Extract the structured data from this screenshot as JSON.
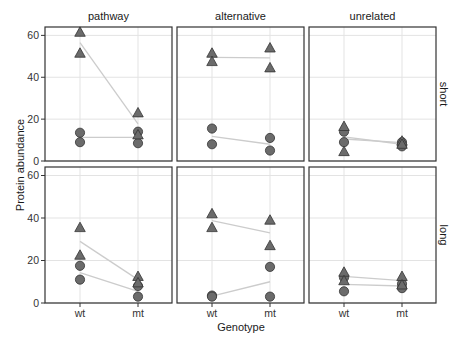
{
  "chart_data": {
    "type": "scatter",
    "title": "",
    "xlabel": "Genotype",
    "ylabel": "Protein abundance",
    "x_categories": [
      "wt",
      "mt"
    ],
    "ylim": [
      0,
      64
    ],
    "y_ticks": [
      0,
      20,
      40,
      60
    ],
    "grid": true,
    "facet_columns": [
      "pathway",
      "alternative",
      "unrelated"
    ],
    "facet_rows": [
      "short",
      "long"
    ],
    "marker_shapes": {
      "circle": "series A (circle)",
      "triangle": "series B (triangle)"
    },
    "colors": {
      "marker_fill": "#6b6b6b",
      "marker_stroke": "#333333",
      "mean_line": "#cccccc",
      "grid": "#e3e3e3",
      "panel_border": "#333333"
    },
    "panels": [
      {
        "row": "short",
        "col": "pathway",
        "triangle": {
          "wt": [
            61.5,
            51.5
          ],
          "mt": [
            23,
            12.5
          ]
        },
        "circle": {
          "wt": [
            13.5,
            9
          ],
          "mt": [
            14,
            8.5
          ]
        }
      },
      {
        "row": "short",
        "col": "alternative",
        "triangle": {
          "wt": [
            51.5,
            47.5
          ],
          "mt": [
            54,
            44.5
          ]
        },
        "circle": {
          "wt": [
            15.5,
            8
          ],
          "mt": [
            11,
            5
          ]
        }
      },
      {
        "row": "short",
        "col": "unrelated",
        "triangle": {
          "wt": [
            16.5,
            4.5
          ],
          "mt": [
            9.5,
            8
          ]
        },
        "circle": {
          "wt": [
            14,
            9
          ],
          "mt": [
            9,
            7
          ]
        }
      },
      {
        "row": "long",
        "col": "pathway",
        "triangle": {
          "wt": [
            35.5,
            22.5
          ],
          "mt": [
            12.5,
            9.5
          ]
        },
        "circle": {
          "wt": [
            17.5,
            11
          ],
          "mt": [
            8,
            3
          ]
        }
      },
      {
        "row": "long",
        "col": "alternative",
        "triangle": {
          "wt": [
            42,
            35.5
          ],
          "mt": [
            39,
            27
          ]
        },
        "circle": {
          "wt": [
            3.5,
            3
          ],
          "mt": [
            17,
            3
          ]
        }
      },
      {
        "row": "long",
        "col": "unrelated",
        "triangle": {
          "wt": [
            14.5,
            10.5
          ],
          "mt": [
            12.5,
            8.5
          ]
        },
        "circle": {
          "wt": [
            12,
            5.5
          ],
          "mt": [
            9,
            7
          ]
        }
      }
    ],
    "legend": "none",
    "annotations": "grey lines connect wt and mt group means per shape"
  },
  "labels": {
    "ylabel": "Protein abundance",
    "xlabel": "Genotype",
    "cols": [
      "pathway",
      "alternative",
      "unrelated"
    ],
    "rows": [
      "short",
      "long"
    ]
  }
}
